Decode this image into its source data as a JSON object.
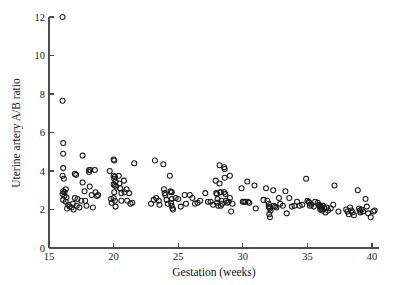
{
  "chart_data": {
    "type": "scatter",
    "title": "",
    "xlabel": "Gestation (weeks)",
    "ylabel": "Uterine artery A/B ratio",
    "xlim": [
      15,
      40.6
    ],
    "ylim": [
      0,
      12
    ],
    "xticks": [
      15,
      20,
      25,
      30,
      35,
      40
    ],
    "yticks": [
      0,
      2,
      4,
      6,
      8,
      10,
      12
    ],
    "grid": false,
    "legend": null,
    "marker": "open-circle",
    "marker_color": "#1a1a1a",
    "n_points": 201,
    "series": [
      {
        "name": "Uterine artery A/B ratio",
        "points": [
          [
            16.05,
            12.0
          ],
          [
            16.05,
            7.65
          ],
          [
            16.1,
            5.45
          ],
          [
            16.1,
            4.9
          ],
          [
            16.1,
            4.15
          ],
          [
            16.05,
            3.75
          ],
          [
            16.15,
            3.6
          ],
          [
            16.3,
            3.05
          ],
          [
            16.1,
            2.95
          ],
          [
            16.2,
            2.9
          ],
          [
            16.05,
            2.8
          ],
          [
            16.2,
            2.72
          ],
          [
            16.35,
            2.62
          ],
          [
            16.1,
            2.5
          ],
          [
            16.3,
            2.4
          ],
          [
            16.5,
            2.25
          ],
          [
            16.6,
            2.15
          ],
          [
            16.4,
            2.05
          ],
          [
            16.75,
            2.1
          ],
          [
            16.9,
            2.0
          ],
          [
            16.85,
            2.3
          ],
          [
            17.0,
            3.85
          ],
          [
            17.1,
            3.8
          ],
          [
            17.0,
            2.6
          ],
          [
            17.2,
            2.55
          ],
          [
            17.15,
            2.2
          ],
          [
            17.35,
            2.1
          ],
          [
            17.5,
            2.45
          ],
          [
            17.6,
            4.8
          ],
          [
            17.6,
            3.4
          ],
          [
            17.75,
            2.95
          ],
          [
            17.8,
            2.45
          ],
          [
            17.9,
            2.2
          ],
          [
            18.1,
            4.05
          ],
          [
            18.1,
            3.95
          ],
          [
            18.2,
            4.05
          ],
          [
            18.15,
            3.2
          ],
          [
            18.3,
            2.75
          ],
          [
            18.4,
            2.1
          ],
          [
            18.55,
            4.05
          ],
          [
            18.6,
            2.9
          ],
          [
            18.7,
            2.7
          ],
          [
            18.8,
            2.75
          ],
          [
            19.7,
            4.0
          ],
          [
            19.8,
            2.55
          ],
          [
            19.85,
            2.35
          ],
          [
            20.0,
            4.6
          ],
          [
            20.05,
            4.55
          ],
          [
            20.0,
            3.75
          ],
          [
            20.1,
            3.7
          ],
          [
            20.05,
            3.6
          ],
          [
            20.15,
            3.45
          ],
          [
            20.0,
            3.3
          ],
          [
            20.1,
            3.25
          ],
          [
            20.2,
            3.2
          ],
          [
            20.05,
            2.9
          ],
          [
            20.0,
            2.6
          ],
          [
            20.1,
            2.45
          ],
          [
            20.15,
            2.15
          ],
          [
            20.4,
            3.75
          ],
          [
            20.45,
            3.35
          ],
          [
            20.5,
            3.1
          ],
          [
            20.6,
            2.85
          ],
          [
            20.6,
            2.45
          ],
          [
            20.8,
            3.5
          ],
          [
            20.85,
            2.9
          ],
          [
            21.0,
            3.05
          ],
          [
            21.05,
            2.45
          ],
          [
            21.2,
            2.85
          ],
          [
            21.3,
            2.3
          ],
          [
            21.45,
            2.35
          ],
          [
            21.6,
            4.4
          ],
          [
            22.9,
            2.3
          ],
          [
            23.1,
            2.5
          ],
          [
            23.2,
            4.55
          ],
          [
            23.3,
            2.6
          ],
          [
            23.5,
            2.45
          ],
          [
            23.55,
            2.25
          ],
          [
            23.85,
            4.35
          ],
          [
            23.9,
            3.05
          ],
          [
            23.95,
            2.85
          ],
          [
            24.0,
            2.75
          ],
          [
            24.1,
            2.5
          ],
          [
            24.2,
            2.3
          ],
          [
            24.35,
            3.75
          ],
          [
            24.4,
            2.95
          ],
          [
            24.45,
            2.9
          ],
          [
            24.5,
            2.9
          ],
          [
            24.5,
            2.55
          ],
          [
            24.45,
            2.35
          ],
          [
            24.5,
            2.2
          ],
          [
            24.55,
            2.05
          ],
          [
            24.6,
            2.0
          ],
          [
            24.8,
            2.6
          ],
          [
            25.0,
            2.55
          ],
          [
            25.2,
            2.15
          ],
          [
            25.5,
            2.75
          ],
          [
            25.6,
            2.3
          ],
          [
            25.9,
            2.75
          ],
          [
            26.1,
            2.6
          ],
          [
            26.3,
            2.3
          ],
          [
            26.5,
            2.35
          ],
          [
            26.7,
            2.45
          ],
          [
            27.1,
            2.85
          ],
          [
            27.3,
            2.4
          ],
          [
            27.5,
            2.4
          ],
          [
            27.7,
            2.25
          ],
          [
            27.9,
            3.5
          ],
          [
            27.95,
            2.85
          ],
          [
            28.0,
            2.8
          ],
          [
            28.05,
            2.55
          ],
          [
            28.0,
            2.35
          ],
          [
            28.1,
            2.2
          ],
          [
            28.2,
            4.3
          ],
          [
            28.2,
            3.35
          ],
          [
            28.25,
            2.9
          ],
          [
            28.3,
            2.9
          ],
          [
            28.35,
            2.45
          ],
          [
            28.4,
            2.3
          ],
          [
            28.3,
            2.2
          ],
          [
            28.55,
            4.2
          ],
          [
            28.6,
            4.1
          ],
          [
            28.6,
            3.65
          ],
          [
            28.55,
            2.9
          ],
          [
            28.65,
            2.8
          ],
          [
            28.7,
            2.45
          ],
          [
            28.8,
            2.35
          ],
          [
            28.9,
            2.4
          ],
          [
            29.0,
            3.75
          ],
          [
            29.0,
            2.6
          ],
          [
            29.1,
            1.9
          ],
          [
            29.2,
            2.3
          ],
          [
            29.9,
            3.1
          ],
          [
            30.0,
            2.4
          ],
          [
            30.1,
            2.4
          ],
          [
            30.2,
            2.4
          ],
          [
            30.35,
            3.45
          ],
          [
            30.4,
            2.4
          ],
          [
            30.5,
            2.35
          ],
          [
            30.9,
            3.25
          ],
          [
            31.0,
            2.05
          ],
          [
            31.6,
            2.5
          ],
          [
            31.8,
            3.1
          ],
          [
            31.9,
            2.45
          ],
          [
            32.0,
            2.3
          ],
          [
            32.0,
            2.15
          ],
          [
            32.05,
            2.1
          ],
          [
            32.1,
            2.05
          ],
          [
            32.15,
            1.95
          ],
          [
            32.05,
            1.75
          ],
          [
            32.1,
            1.6
          ],
          [
            32.35,
            3.0
          ],
          [
            32.4,
            2.2
          ],
          [
            32.5,
            2.15
          ],
          [
            32.6,
            2.1
          ],
          [
            32.8,
            2.6
          ],
          [
            32.9,
            2.3
          ],
          [
            33.1,
            2.2
          ],
          [
            33.3,
            2.95
          ],
          [
            33.4,
            1.8
          ],
          [
            33.6,
            2.6
          ],
          [
            33.8,
            2.15
          ],
          [
            34.0,
            2.2
          ],
          [
            34.2,
            2.4
          ],
          [
            34.4,
            2.2
          ],
          [
            34.6,
            2.25
          ],
          [
            34.9,
            3.6
          ],
          [
            35.0,
            2.45
          ],
          [
            35.1,
            2.4
          ],
          [
            35.15,
            2.35
          ],
          [
            35.2,
            2.2
          ],
          [
            35.3,
            2.25
          ],
          [
            35.5,
            2.15
          ],
          [
            35.6,
            2.4
          ],
          [
            35.8,
            2.35
          ],
          [
            35.9,
            2.25
          ],
          [
            35.95,
            2.15
          ],
          [
            36.0,
            2.2
          ],
          [
            36.05,
            2.1
          ],
          [
            36.0,
            2.0
          ],
          [
            36.1,
            2.05
          ],
          [
            36.15,
            1.95
          ],
          [
            36.2,
            2.2
          ],
          [
            36.3,
            2.1
          ],
          [
            36.4,
            1.85
          ],
          [
            36.5,
            2.1
          ],
          [
            36.6,
            1.95
          ],
          [
            36.8,
            2.05
          ],
          [
            37.0,
            2.25
          ],
          [
            37.1,
            3.25
          ],
          [
            37.4,
            1.9
          ],
          [
            38.0,
            2.0
          ],
          [
            38.1,
            1.9
          ],
          [
            38.2,
            1.75
          ],
          [
            38.3,
            2.1
          ],
          [
            38.4,
            1.95
          ],
          [
            38.5,
            1.85
          ],
          [
            38.6,
            1.7
          ],
          [
            38.9,
            3.0
          ],
          [
            39.0,
            2.05
          ],
          [
            39.05,
            1.95
          ],
          [
            39.1,
            1.85
          ],
          [
            39.2,
            2.0
          ],
          [
            39.3,
            1.9
          ],
          [
            39.5,
            2.55
          ],
          [
            39.6,
            2.15
          ],
          [
            39.7,
            1.8
          ],
          [
            39.9,
            1.6
          ],
          [
            40.1,
            1.9
          ],
          [
            40.2,
            1.95
          ]
        ]
      }
    ]
  },
  "axes": {
    "x_tick_labels": [
      "15",
      "20",
      "25",
      "30",
      "35",
      "40"
    ],
    "y_tick_labels": [
      "0",
      "2",
      "4",
      "6",
      "8",
      "10",
      "12"
    ],
    "x_axis_title": "Gestation (weeks)",
    "y_axis_title": "Uterine artery A/B ratio"
  }
}
